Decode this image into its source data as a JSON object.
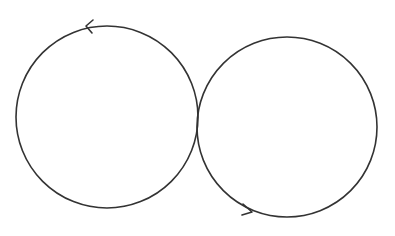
{
  "diagram": {
    "type": "figure-eight-loops",
    "background": "#ffffff",
    "stroke_color": "#333333",
    "circles": [
      {
        "name": "left-circle",
        "cx": 107,
        "cy": 117,
        "r": 91,
        "direction": "counterclockwise"
      },
      {
        "name": "right-circle",
        "cx": 287,
        "cy": 127,
        "r": 90,
        "direction": "counterclockwise"
      }
    ],
    "arrows": [
      {
        "name": "left-circle-arrow",
        "tip_x": 86,
        "tip_y": 26,
        "points": "left"
      },
      {
        "name": "right-circle-arrow",
        "tip_x": 252,
        "tip_y": 212,
        "points": "right"
      }
    ]
  }
}
